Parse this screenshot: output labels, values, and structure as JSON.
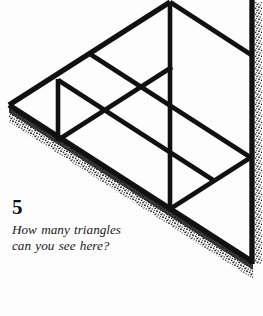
{
  "page": {
    "background_color": "#fdfdfd",
    "ink_color": "#111111",
    "width": 263,
    "height": 316
  },
  "puzzle": {
    "number": "5",
    "question": "How many triangles can you see here?"
  },
  "figure": {
    "name": "triangle-subdivision-figure",
    "stroke_color": "#111111",
    "shadow_color": "#1c1c1c",
    "vertices": {
      "left": [
        9,
        105
      ],
      "top": [
        170,
        2
      ],
      "bottom_right": [
        253,
        262
      ],
      "top_right": [
        253,
        2
      ]
    },
    "strokes": [
      {
        "name": "outer-edge-top-left",
        "from": [
          9,
          105
        ],
        "to": [
          170,
          2
        ],
        "width": 5.2
      },
      {
        "name": "outer-edge-bottom",
        "from": [
          9,
          105
        ],
        "to": [
          253,
          262
        ],
        "width": 5.2
      },
      {
        "name": "outer-edge-right-vertical",
        "from": [
          253,
          2
        ],
        "to": [
          253,
          262
        ],
        "width": 5.2
      },
      {
        "name": "inner-diagonal-long",
        "from": [
          90,
          54
        ],
        "to": [
          253,
          159
        ],
        "width": 4.6
      },
      {
        "name": "inner-diagonal-mid",
        "from": [
          58,
          80
        ],
        "to": [
          212,
          178
        ],
        "width": 4.6
      },
      {
        "name": "inner-diagonal-short-top",
        "from": [
          170,
          2
        ],
        "to": [
          253,
          56
        ],
        "width": 4.6
      },
      {
        "name": "inner-diagonal-short-bottom",
        "from": [
          212,
          178
        ],
        "to": [
          253,
          262
        ],
        "width": 4.6
      },
      {
        "name": "inner-vertical-left",
        "from": [
          58,
          80
        ],
        "to": [
          58,
          140
        ],
        "width": 4.6
      },
      {
        "name": "inner-vertical-mid",
        "from": [
          170,
          2
        ],
        "to": [
          170,
          209
        ],
        "width": 4.6
      },
      {
        "name": "cross-diagonal-upward",
        "from": [
          58,
          140
        ],
        "to": [
          170,
          68
        ],
        "width": 4.6
      },
      {
        "name": "cross-diagonal-lower",
        "from": [
          170,
          209
        ],
        "to": [
          253,
          156
        ],
        "width": 4.6
      }
    ],
    "shadow_edge": {
      "name": "stipple-shadow-bottom-edge",
      "from": [
        9,
        110
      ],
      "to": [
        253,
        268
      ],
      "width": 9
    }
  }
}
